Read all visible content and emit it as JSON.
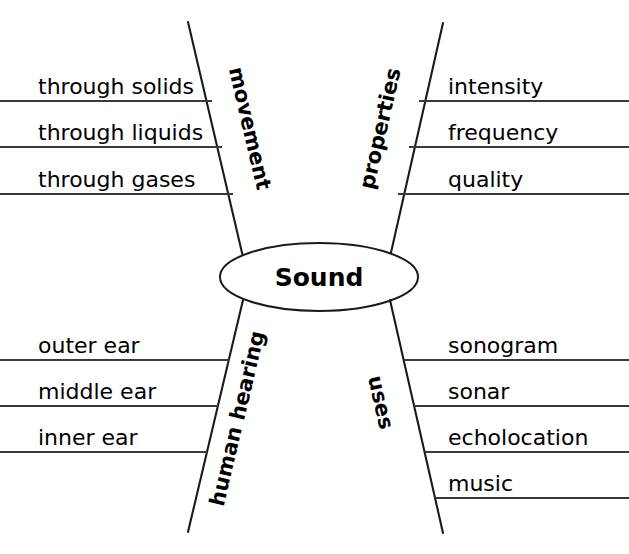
{
  "diagram": {
    "type": "concept-map",
    "center": {
      "label": "Sound"
    },
    "branches": [
      {
        "id": "movement",
        "label": "movement",
        "position": "top-left",
        "items": [
          "through solids",
          "through liquids",
          "through gases"
        ]
      },
      {
        "id": "properties",
        "label": "properties",
        "position": "top-right",
        "items": [
          "intensity",
          "frequency",
          "quality"
        ]
      },
      {
        "id": "human-hearing",
        "label": "human hearing",
        "position": "bottom-left",
        "items": [
          "outer ear",
          "middle ear",
          "inner ear"
        ]
      },
      {
        "id": "uses",
        "label": "uses",
        "position": "bottom-right",
        "items": [
          "sonogram",
          "sonar",
          "echolocation",
          "music"
        ]
      }
    ],
    "colors": {
      "background": "#ffffff",
      "stroke": "#1a1a1a",
      "rule": "#3a3a3a",
      "text": "#000000"
    }
  }
}
